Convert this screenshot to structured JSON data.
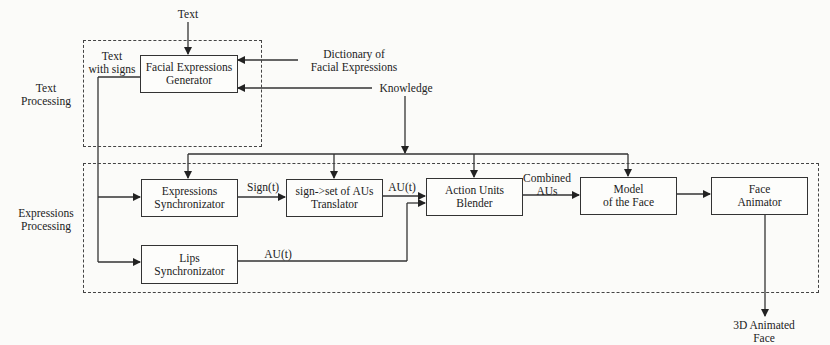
{
  "diagram": {
    "groups": {
      "text_processing": "Text\nProcessing",
      "expressions_processing": "Expressions\nProcessing"
    },
    "inputs": {
      "text": "Text",
      "dictionary": "Dictionary of\nFacial Expressions",
      "knowledge": "Knowledge"
    },
    "blocks": {
      "facial_expressions_generator": "Facial Expressions\nGenerator",
      "expressions_synchronizator": "Expressions\nSynchronizator",
      "translator": "sign->set of AUs\nTranslator",
      "lips_synchronizator": "Lips\nSynchronizator",
      "action_units_blender": "Action Units\nBlender",
      "model_of_face": "Model\nof the Face",
      "face_animator": "Face\nAnimator"
    },
    "edge_labels": {
      "text_with_signs": "Text\nwith signs",
      "sign_t": "Sign(t)",
      "au_t_translator": "AU(t)",
      "au_t_lips": "AU(t)",
      "combined_aus": "Combined\nAUs"
    },
    "output": "3D Animated\nFace"
  }
}
